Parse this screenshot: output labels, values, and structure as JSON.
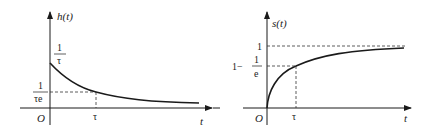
{
  "left_plot": {
    "y_label": "h(t)",
    "x_label": "t",
    "origin": "O",
    "peak_num": "1",
    "peak_den": "τ",
    "level_num": "1",
    "level_den": "τe",
    "tau_tick": "τ",
    "curve": "exponential decay"
  },
  "right_plot": {
    "y_label": "s(t)",
    "x_label": "t",
    "origin": "O",
    "asymptote_label": "1",
    "level_prefix": "1−",
    "level_num": "1",
    "level_den": "e",
    "tau_tick": "τ",
    "curve": "exponential rise"
  },
  "colors": {
    "line": "#1a1a1a",
    "dash": "#333333",
    "background": "#ffffff"
  }
}
